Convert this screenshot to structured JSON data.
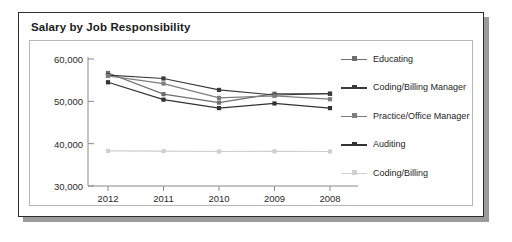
{
  "card": {
    "title": "Salary by Job Responsibility"
  },
  "chart_data": {
    "type": "line",
    "title": "Salary by Job Responsibility",
    "xlabel": "",
    "ylabel": "",
    "categories": [
      "2012",
      "2011",
      "2010",
      "2009",
      "2008"
    ],
    "ylim": [
      30000,
      60000
    ],
    "yticks": [
      30000,
      40000,
      50000,
      60000
    ],
    "ytick_labels": [
      "30,000",
      "40,000",
      "50,000",
      "60,000"
    ],
    "grid": false,
    "legend_position": "right",
    "series": [
      {
        "name": "Educating",
        "color": "#6e6e6e",
        "values": [
          56700,
          51700,
          49700,
          51800,
          51800
        ]
      },
      {
        "name": "Coding/Billing Manager",
        "color": "#3a3a3a",
        "values": [
          56200,
          55400,
          52700,
          51500,
          51800
        ]
      },
      {
        "name": "Practice/Office Manager",
        "color": "#7d7d7d",
        "values": [
          56000,
          54200,
          50800,
          51300,
          50500
        ]
      },
      {
        "name": "Auditing",
        "color": "#333333",
        "values": [
          54500,
          50400,
          48400,
          49500,
          48400
        ]
      },
      {
        "name": "Coding/Billing",
        "color": "#cfcfcf",
        "values": [
          38300,
          38250,
          38150,
          38200,
          38150
        ]
      }
    ]
  }
}
